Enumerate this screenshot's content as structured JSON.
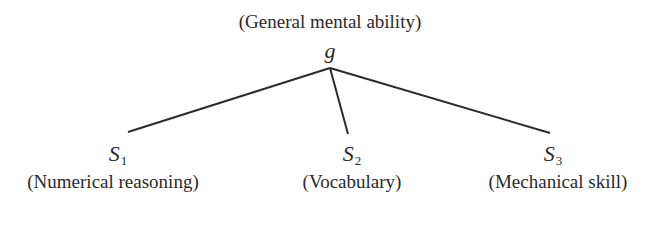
{
  "diagram": {
    "root": {
      "caption": "(General mental ability)",
      "symbol": "g"
    },
    "children": [
      {
        "symbol": "S",
        "subscript": "1",
        "caption": "(Numerical reasoning)"
      },
      {
        "symbol": "S",
        "subscript": "2",
        "caption": "(Vocabulary)"
      },
      {
        "symbol": "S",
        "subscript": "3",
        "caption": "(Mechanical skill)"
      }
    ],
    "line_color": "#2a2a2a"
  }
}
